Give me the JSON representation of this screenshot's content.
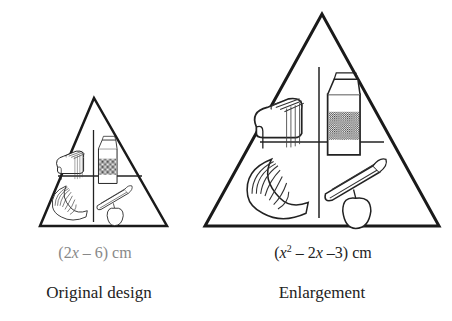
{
  "figures": [
    {
      "id": "original",
      "dimension_label": {
        "open": "(2",
        "var": "x",
        "rest": " – 6) cm"
      },
      "caption": "Original design",
      "dimension_color": "#888888"
    },
    {
      "id": "enlargement",
      "dimension_label": {
        "open": "(",
        "var1": "x",
        "sup": "2",
        "mid": " – 2",
        "var2": "x",
        "rest": " –3) cm"
      },
      "caption": "Enlargement",
      "dimension_color": "#222222"
    }
  ],
  "icons": [
    "bread-loaf-icon",
    "milk-carton-icon",
    "meat-slices-icon",
    "asparagus-icon",
    "apple-icon"
  ]
}
